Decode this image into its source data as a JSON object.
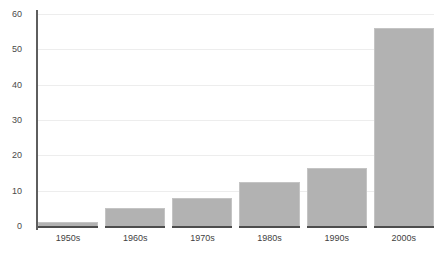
{
  "chart_data": {
    "type": "bar",
    "title": "",
    "subtitle": "",
    "xlabel": "",
    "ylabel": "",
    "categories": [
      "1950s",
      "1960s",
      "1970s",
      "1980s",
      "1990s",
      "2000s"
    ],
    "values": [
      1,
      5,
      8,
      12.5,
      16.5,
      56
    ],
    "ylim": [
      0,
      60
    ],
    "yticks": [
      0,
      10,
      20,
      30,
      40,
      50,
      60
    ],
    "ytick_labels": [
      "0",
      "10",
      "20",
      "30",
      "40",
      "50",
      "60"
    ],
    "grid": true,
    "grid_axis": "y",
    "legend": false,
    "legend_position": "none",
    "annotations": [],
    "colors": {
      "bar_fill": "#b2b2b2",
      "bar_border": "#c4c4c4",
      "gridline": "#ededed",
      "axis_line": "#5e5e5e",
      "baseline": "#4d4d4d",
      "tick_text": "#3f3f3f",
      "background": "#ffffff"
    }
  }
}
